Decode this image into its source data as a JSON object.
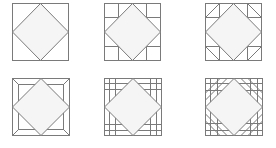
{
  "figure": {
    "stroke_color": "#7a7a7a",
    "diamond_fill": "#f5f5f5",
    "background": "#ffffff"
  },
  "tiles": [
    {
      "id": "plain-diamond",
      "row": 0,
      "col": 0,
      "x": 12,
      "y": 3,
      "size": 57,
      "variant": "plain"
    },
    {
      "id": "corner-squares",
      "row": 0,
      "col": 1,
      "x": 104,
      "y": 3,
      "size": 57,
      "variant": "corner-grid"
    },
    {
      "id": "corner-triangles",
      "row": 0,
      "col": 2,
      "x": 205,
      "y": 3,
      "size": 57,
      "variant": "corner-triangles"
    },
    {
      "id": "mitered-frame",
      "row": 1,
      "col": 0,
      "x": 12,
      "y": 78,
      "size": 58,
      "variant": "frame"
    },
    {
      "id": "double-grid",
      "row": 1,
      "col": 1,
      "x": 104,
      "y": 78,
      "size": 58,
      "variant": "double-grid"
    },
    {
      "id": "grid-with-diagonals",
      "row": 1,
      "col": 2,
      "x": 205,
      "y": 78,
      "size": 58,
      "variant": "grid-diagonals"
    }
  ]
}
